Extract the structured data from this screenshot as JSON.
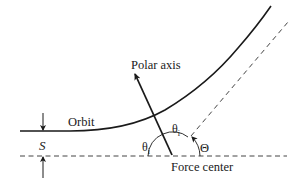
{
  "diagram": {
    "labels": {
      "polar_axis": "Polar axis",
      "orbit": "Orbit",
      "separation": "S",
      "theta_i_left": "θ",
      "theta_i_left_sub": "i",
      "theta_i_right": "θ",
      "theta_i_right_sub": "i",
      "deflection_angle": "Θ",
      "force_center": "Force center"
    },
    "colors": {
      "ink": "#1a1a1a",
      "dashed": "#444444",
      "background": "#ffffff"
    }
  }
}
